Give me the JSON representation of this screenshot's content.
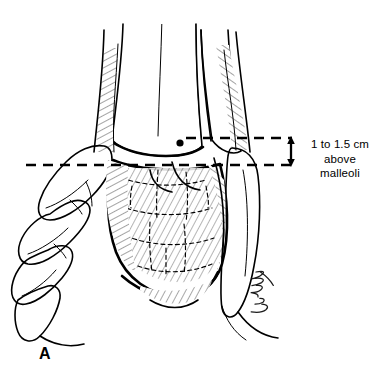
{
  "figure": {
    "domain": "medical-illustration",
    "panel_label": "A",
    "background_color": "#ffffff",
    "ink_color": "#000000",
    "annotation": {
      "line1": "1 to 1.5 cm",
      "line2": "above",
      "line3": "malleoli"
    },
    "signature": "Nguyen",
    "measurement": {
      "top_dashed_line_y": 138,
      "bottom_dashed_line_y": 165,
      "arrow_x": 292,
      "arrow_type": "double-headed-vertical"
    },
    "landmark_dot": {
      "x": 180,
      "y": 143
    }
  }
}
